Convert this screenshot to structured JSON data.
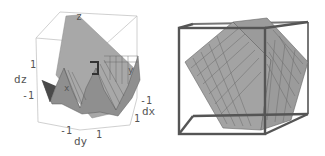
{
  "figure": {
    "left_plot": {
      "type": "3d-surface",
      "axis_labels": {
        "x": "dy",
        "y": "dx",
        "z": "dz"
      },
      "z_ticks": [
        "1",
        "-1"
      ],
      "y_ticks": [
        "-1",
        "1"
      ],
      "x_ticks": [
        "-1",
        "1"
      ],
      "surface_labels": [
        "z",
        "x",
        "y"
      ],
      "colors": {
        "surface": "#9a9a9a",
        "box": "#bbbbbb",
        "text": "#555555"
      }
    },
    "right_plot": {
      "type": "3d-surface",
      "description": "Mesh-gridded tilted planes inside a bounding cube",
      "colors": {
        "surface": "#a0a0a0",
        "box": "#555555",
        "grid": "#6e6e6e"
      }
    }
  }
}
